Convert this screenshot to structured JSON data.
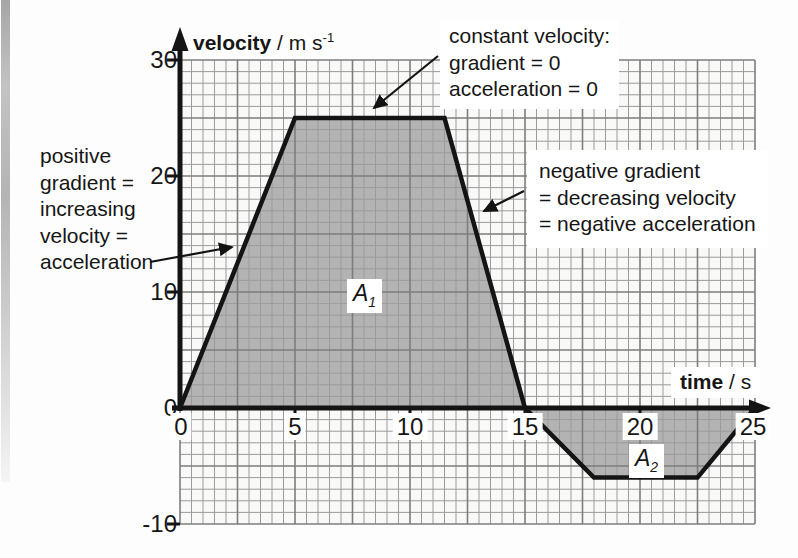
{
  "chart_data": {
    "type": "line",
    "title": "",
    "xlabel": {
      "bold": "time",
      "units": " / s"
    },
    "ylabel": {
      "bold": "velocity",
      "units": " / m s",
      "units_sup": "-1"
    },
    "xlim": [
      0,
      25
    ],
    "ylim": [
      -10,
      30
    ],
    "x_ticks": [
      "0",
      "5",
      "10",
      "15",
      "20",
      "25"
    ],
    "y_ticks": [
      "30",
      "20",
      "10",
      "0",
      "-10"
    ],
    "grid": {
      "on": true,
      "minor_step_x_s": 0.5,
      "minor_step_y_ms": 1,
      "major_every_minor": 5
    },
    "series": [
      {
        "name": "velocity-time curve",
        "points": [
          [
            0,
            0
          ],
          [
            5,
            25
          ],
          [
            11.5,
            25
          ],
          [
            15,
            0
          ],
          [
            18,
            -6
          ],
          [
            22.5,
            -6
          ],
          [
            25,
            0
          ]
        ]
      }
    ],
    "areas": [
      {
        "name": "A1",
        "label": "A",
        "sub": "1",
        "points": [
          [
            0,
            0
          ],
          [
            5,
            25
          ],
          [
            11.5,
            25
          ],
          [
            15,
            0
          ]
        ],
        "label_at": [
          7.9,
          9.6
        ]
      },
      {
        "name": "A2",
        "label": "A",
        "sub": "2",
        "points": [
          [
            15,
            0
          ],
          [
            18,
            -6
          ],
          [
            22.5,
            -6
          ],
          [
            25,
            0
          ]
        ],
        "label_at": [
          20.3,
          -4.6
        ]
      }
    ],
    "colors": {
      "ink": "#141414",
      "area_fill": "#b3b3b3",
      "grid_minor": "#9b9b9b",
      "grid_major": "#7d7d7d",
      "plot_bg": "#f9f9f8",
      "label_box_bg": "#ffffff"
    }
  },
  "annotations": {
    "positive_gradient": {
      "lines": [
        "positive",
        "gradient =",
        "increasing",
        "velocity =",
        "acceleration"
      ]
    },
    "constant_velocity": {
      "lines": [
        "constant velocity:",
        "gradient = 0",
        "acceleration = 0"
      ]
    },
    "negative_gradient": {
      "lines": [
        "negative gradient",
        "= decreasing velocity",
        "= negative acceleration"
      ]
    }
  }
}
